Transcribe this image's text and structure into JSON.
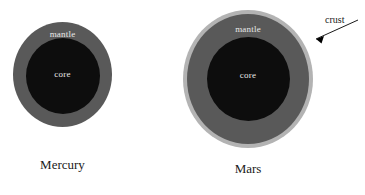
{
  "figure": {
    "background_color": "#ffffff",
    "width": 365,
    "height": 195
  },
  "palette": {
    "core_color": "#0d0d0d",
    "mantle_color": "#595959",
    "crust_color": "#b3b3b3",
    "label_light": "#e8e8e8",
    "label_dark": "#1a1a1a",
    "arrow_color": "#000000"
  },
  "planets": [
    {
      "name": "Mercury",
      "layers": [
        {
          "label": "mantle",
          "color": "#595959"
        },
        {
          "label": "core",
          "color": "#0d0d0d"
        }
      ]
    },
    {
      "name": "Mars",
      "layers": [
        {
          "label": "crust",
          "color": "#b3b3b3"
        },
        {
          "label": "mantle",
          "color": "#595959"
        },
        {
          "label": "core",
          "color": "#0d0d0d"
        }
      ]
    }
  ],
  "mercury": {
    "name": "Mercury",
    "mantle_label": "mantle",
    "core_label": "core"
  },
  "mars": {
    "name": "Mars",
    "mantle_label": "mantle",
    "core_label": "core",
    "crust_label": "crust"
  }
}
